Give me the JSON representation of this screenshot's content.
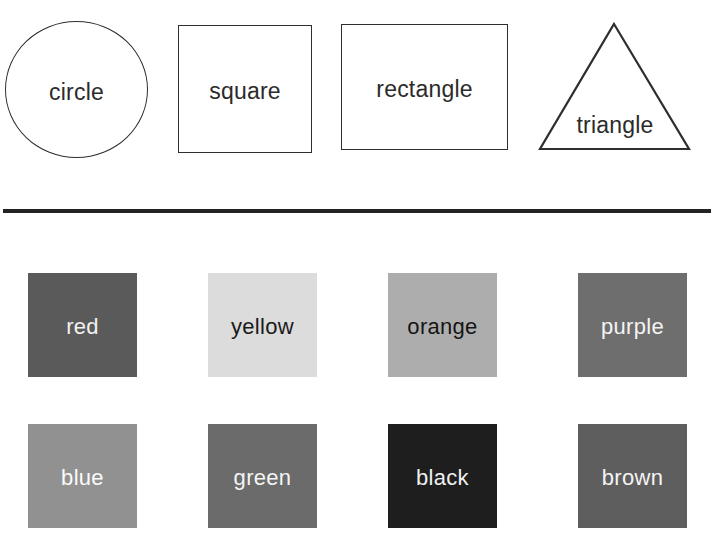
{
  "page": {
    "background": "#ffffff",
    "width": 715,
    "height": 540
  },
  "shapes_section": {
    "outline_color": "#2e2e2e",
    "label_color": "#2b2b2b",
    "items": [
      {
        "name": "circle",
        "label": "circle"
      },
      {
        "name": "square",
        "label": "square"
      },
      {
        "name": "rectangle",
        "label": "rectangle"
      },
      {
        "name": "triangle",
        "label": "triangle"
      }
    ]
  },
  "divider": {
    "color": "#232323"
  },
  "colors_section": {
    "rows": [
      {
        "swatches": [
          {
            "label": "red",
            "fill": "#5a5a5a",
            "text_color": "#f2f2f2"
          },
          {
            "label": "yellow",
            "fill": "#dcdcdc",
            "text_color": "#1a1a1a"
          },
          {
            "label": "orange",
            "fill": "#adadad",
            "text_color": "#151515"
          },
          {
            "label": "purple",
            "fill": "#6e6e6e",
            "text_color": "#f4f4f4"
          }
        ]
      },
      {
        "swatches": [
          {
            "label": "blue",
            "fill": "#919191",
            "text_color": "#fbfbfb"
          },
          {
            "label": "green",
            "fill": "#6b6b6b",
            "text_color": "#f4f4f4"
          },
          {
            "label": "black",
            "fill": "#1e1e1e",
            "text_color": "#f0f0f0"
          },
          {
            "label": "brown",
            "fill": "#5e5e5e",
            "text_color": "#f4f4f4"
          }
        ]
      }
    ]
  }
}
